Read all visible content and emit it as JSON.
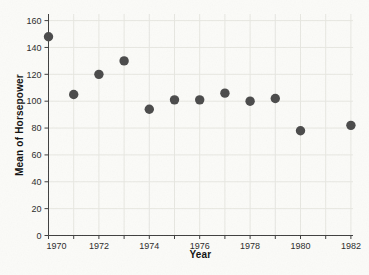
{
  "chart_data": {
    "type": "scatter",
    "title": "",
    "xlabel": "Year",
    "ylabel": "Mean of Horsepower",
    "x": [
      1970,
      1971,
      1972,
      1973,
      1974,
      1975,
      1976,
      1977,
      1978,
      1979,
      1980,
      1982
    ],
    "y": [
      148,
      105,
      120,
      130,
      94,
      101,
      101,
      106,
      100,
      102,
      78,
      82
    ],
    "xlim": [
      1970,
      1982
    ],
    "ylim": [
      0,
      160
    ],
    "x_tick_labels": [
      "1970",
      "1972",
      "1974",
      "1976",
      "1978",
      "1980",
      "1982"
    ],
    "x_minor_tick_step": 1,
    "y_tick_step": 20,
    "y_tick_labels": [
      "0",
      "20",
      "40",
      "60",
      "80",
      "100",
      "120",
      "140",
      "160"
    ],
    "layout": {
      "grid": "both",
      "legend": "none",
      "first_x_label_shift_px": 8
    },
    "marker": {
      "shape": "circle",
      "color": "#4a4a4a",
      "radius_px": 4.7
    },
    "colors": {
      "background": "#fbfbf8",
      "grid": "#e7e7e1",
      "axis": "#3f3f3f",
      "tick": "#3f3f3f",
      "tick_label": "#2a2a2a"
    }
  }
}
